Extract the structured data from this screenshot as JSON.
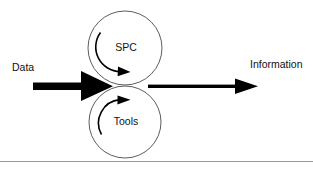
{
  "diagram": {
    "type": "process-flow",
    "background_color": "#ffffff",
    "ink_color": "#000000",
    "outline_color": "#4a4a4a",
    "rule_color": "#8d8d8d",
    "input": {
      "label": "Data",
      "arrow_name": "thick-input-arrow",
      "arrow_style": "thick-filled",
      "direction": "right"
    },
    "output": {
      "label": "Information",
      "arrow_name": "output-arrow",
      "arrow_style": "thin-filled",
      "direction": "right"
    },
    "gears": [
      {
        "label": "SPC",
        "position": "top",
        "center_x": 125,
        "center_y": 48,
        "radius": 37,
        "rotation": "clockwise",
        "arc_arrow_name": "clockwise-rotation-arrow"
      },
      {
        "label": "Tools",
        "position": "bottom",
        "center_x": 125,
        "center_y": 122,
        "radius": 36,
        "rotation": "counter-clockwise",
        "arc_arrow_name": "counter-clockwise-rotation-arrow"
      }
    ],
    "footer_rule": {
      "name": "horizontal-divider",
      "y": 161
    }
  }
}
